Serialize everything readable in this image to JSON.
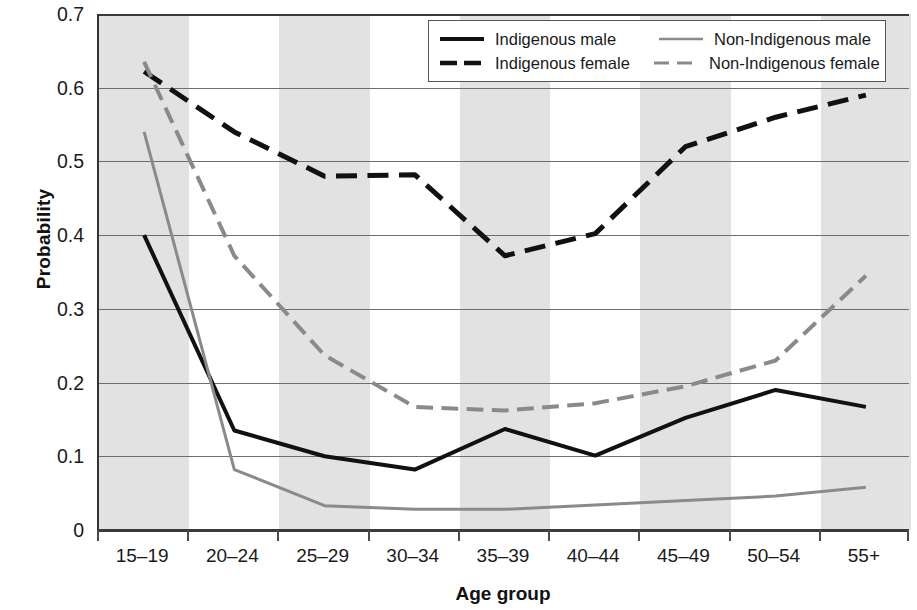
{
  "chart_data": {
    "type": "line",
    "title": "",
    "xlabel": "Age group",
    "ylabel": "Probability",
    "categories": [
      "15–19",
      "20–24",
      "25–29",
      "30–34",
      "35–39",
      "40–44",
      "45–49",
      "50–54",
      "55+"
    ],
    "ylim": [
      0,
      0.7
    ],
    "yticks": [
      "0",
      "0.1",
      "0.2",
      "0.3",
      "0.4",
      "0.5",
      "0.6",
      "0.7"
    ],
    "ytick_values": [
      0,
      0.1,
      0.2,
      0.3,
      0.4,
      0.5,
      0.6,
      0.7
    ],
    "grid": true,
    "legend_position": "top-right",
    "banding": "alternating vertical gray bands per category",
    "series": [
      {
        "name": "Indigenous male",
        "style": "solid",
        "color": "#111111",
        "width": 4,
        "values": [
          0.4,
          0.135,
          0.1,
          0.082,
          0.137,
          0.101,
          0.152,
          0.19,
          0.167
        ]
      },
      {
        "name": "Indigenous female",
        "style": "dashed",
        "color": "#111111",
        "width": 5,
        "values": [
          0.622,
          0.54,
          0.48,
          0.482,
          0.372,
          0.402,
          0.52,
          0.56,
          0.59
        ]
      },
      {
        "name": "Non-Indigenous male",
        "style": "solid",
        "color": "#8a8a8a",
        "width": 3,
        "values": [
          0.54,
          0.082,
          0.033,
          0.028,
          0.028,
          0.034,
          0.04,
          0.046,
          0.058
        ]
      },
      {
        "name": "Non-Indigenous female",
        "style": "dashed",
        "color": "#8a8a8a",
        "width": 4,
        "values": [
          0.635,
          0.372,
          0.237,
          0.167,
          0.162,
          0.172,
          0.195,
          0.23,
          0.345
        ]
      }
    ]
  },
  "axes": {
    "ylabel": "Probability",
    "xlabel": "Age group"
  },
  "legend": {
    "rows": [
      {
        "left": "Indigenous male",
        "right": "Non-Indigenous male"
      },
      {
        "left": "Indigenous female",
        "right": "Non-Indigenous female"
      }
    ]
  },
  "colors": {
    "indigenous": "#111111",
    "non_indigenous": "#8a8a8a",
    "band": "#e2e2e2",
    "grid": "#6e6e6e",
    "axis": "#3a3a3a"
  }
}
